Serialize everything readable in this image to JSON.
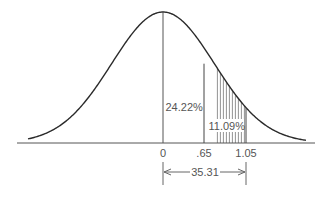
{
  "chart_data": {
    "type": "area",
    "title": "",
    "distribution": "normal",
    "mean": 0,
    "xlabel": "",
    "ylabel": "",
    "tick_labels": [
      "0",
      ".65",
      "1.05"
    ],
    "tick_values": [
      0,
      0.65,
      1.05
    ],
    "shaded_region": {
      "from": 0.65,
      "to": 1.05,
      "label": "11.09%",
      "pattern": "vertical-hatch"
    },
    "annotations": [
      {
        "text": "24.22%",
        "region": "from 0 to .65"
      },
      {
        "text": "11.09%",
        "region": "from .65 to 1.05"
      },
      {
        "text": "35.31",
        "type": "dimension-arrow",
        "from": 0,
        "to": 1.05
      }
    ],
    "grid": false,
    "legend": null
  },
  "labels": {
    "area_0_to_065": "24.22%",
    "area_065_to_105": "11.09%",
    "tick_0": "0",
    "tick_065": ".65",
    "tick_105": "1.05",
    "dimension": "35.31"
  },
  "colors": {
    "curve": "#2a2a2a",
    "axis": "#555555",
    "hatch": "#555555",
    "text": "#555555",
    "background": "#ffffff"
  }
}
